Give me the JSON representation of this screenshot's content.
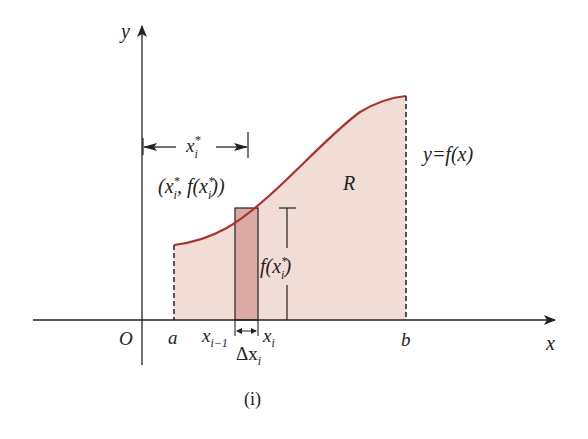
{
  "figure": {
    "caption": "(i)",
    "colors": {
      "region_fill": "#f2dcd6",
      "strip_fill": "#dcaaa4",
      "curve": "#a8332d",
      "axes": "#222222"
    },
    "axes": {
      "x_label": "x",
      "y_label": "y",
      "origin_label": "O"
    },
    "points": {
      "a": "a",
      "b": "b",
      "x_prev": "x",
      "x_prev_sub": "i−1",
      "x_i": "x",
      "x_i_sub": "i",
      "delta": "Δx",
      "delta_sub": "i"
    },
    "annotations": {
      "xstar": "x",
      "xstar_sup": "*",
      "xstar_sub": "i",
      "point_label_open": "(x",
      "point_label_mid": ", f(x",
      "point_label_close": "))",
      "height_label_f": "f(x",
      "height_label_close": ")",
      "region": "R",
      "curve_label": "y=f(x)"
    }
  }
}
